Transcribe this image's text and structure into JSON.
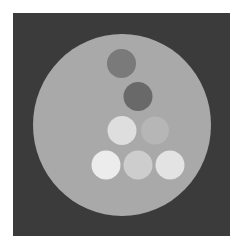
{
  "image": {
    "width": 244,
    "height": 248,
    "background": "#ffffff",
    "frame": {
      "x": 13,
      "y": 13,
      "w": 217,
      "h": 223,
      "color": "#3b3b3b"
    },
    "phantom": {
      "cx": 122,
      "cy": 125,
      "rx": 89,
      "ry": 91,
      "color": "#a9a9a9"
    },
    "inserts": [
      {
        "id": "insert-top",
        "cx": 121.5,
        "cy": 63.5,
        "r": 14.5,
        "color": "#7a7a7a"
      },
      {
        "id": "insert-second",
        "cx": 138,
        "cy": 96.5,
        "r": 14.5,
        "color": "#696969"
      },
      {
        "id": "insert-middle-left",
        "cx": 122,
        "cy": 130.5,
        "r": 14.5,
        "color": "#dedede"
      },
      {
        "id": "insert-middle-right",
        "cx": 155,
        "cy": 130.5,
        "r": 14,
        "color": "#b6b6b6"
      },
      {
        "id": "insert-bottom-left",
        "cx": 106,
        "cy": 165,
        "r": 14.5,
        "color": "#ececec"
      },
      {
        "id": "insert-bottom-middle",
        "cx": 138,
        "cy": 165,
        "r": 14.5,
        "color": "#cdcdcd"
      },
      {
        "id": "insert-bottom-right",
        "cx": 170,
        "cy": 165,
        "r": 14.5,
        "color": "#e3e3e3"
      }
    ]
  }
}
